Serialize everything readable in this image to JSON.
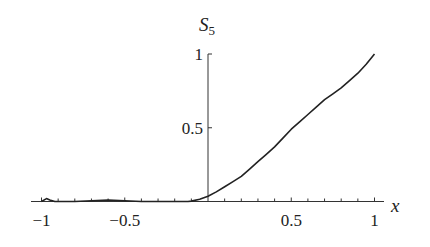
{
  "chart_data": {
    "type": "line",
    "title": "",
    "xlabel": "x",
    "ylabel": "S",
    "ylabel_subscript": "5",
    "xlim": [
      -1,
      1
    ],
    "ylim": [
      0,
      1
    ],
    "grid": false,
    "legend": null,
    "x_ticks": [
      -1,
      -0.5,
      0.5,
      1
    ],
    "x_tick_labels": [
      "−1",
      "−0.5",
      "0.5",
      "1"
    ],
    "x_minor_tick_step": 0.1,
    "y_ticks": [
      0.5,
      1
    ],
    "y_tick_labels": [
      "0.5",
      "1"
    ],
    "series": [
      {
        "name": "S5",
        "color": "#222222",
        "x": [
          -1.0,
          -0.97,
          -0.95,
          -0.92,
          -0.9,
          -0.8,
          -0.7,
          -0.6,
          -0.5,
          -0.4,
          -0.3,
          -0.2,
          -0.12,
          -0.1,
          -0.05,
          0.0,
          0.05,
          0.1,
          0.15,
          0.2,
          0.25,
          0.3,
          0.35,
          0.4,
          0.45,
          0.5,
          0.55,
          0.6,
          0.65,
          0.7,
          0.75,
          0.8,
          0.85,
          0.9,
          0.95,
          1.0
        ],
        "y": [
          0.0,
          0.02,
          0.01,
          0.0,
          0.0,
          0.0,
          0.005,
          0.01,
          0.005,
          0.0,
          0.0,
          0.0,
          0.0,
          0.003,
          0.015,
          0.035,
          0.065,
          0.1,
          0.135,
          0.17,
          0.22,
          0.27,
          0.32,
          0.37,
          0.43,
          0.49,
          0.54,
          0.59,
          0.64,
          0.69,
          0.73,
          0.77,
          0.82,
          0.87,
          0.93,
          1.0
        ]
      }
    ]
  }
}
